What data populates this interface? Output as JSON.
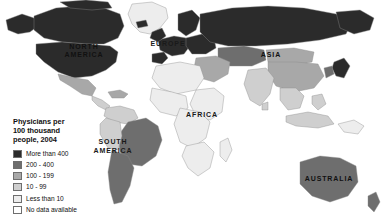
{
  "map": {
    "background_color": "#ffffff",
    "border_color": "#8c8c8c",
    "region_labels": [
      {
        "name": "north-america",
        "text": "NORTH",
        "x": 84,
        "y": 49,
        "on_dark": true
      },
      {
        "name": "north-america",
        "text": "AMERICA",
        "x": 84,
        "y": 57,
        "on_dark": true
      },
      {
        "name": "south-america",
        "text": "SOUTH",
        "x": 113,
        "y": 144,
        "on_dark": false
      },
      {
        "name": "south-america",
        "text": "AMERICA",
        "x": 113,
        "y": 153,
        "on_dark": false
      },
      {
        "name": "europe",
        "text": "EUROPE",
        "x": 168,
        "y": 46,
        "on_dark": false
      },
      {
        "name": "africa",
        "text": "AFRICA",
        "x": 202,
        "y": 117,
        "on_dark": false
      },
      {
        "name": "asia",
        "text": "ASIA",
        "x": 271,
        "y": 57,
        "on_dark": true
      },
      {
        "name": "australia",
        "text": "AUSTRALIA",
        "x": 329,
        "y": 181,
        "on_dark": true
      }
    ]
  },
  "legend": {
    "title": "Physicians per\n100 thousand\npeople, 2004",
    "items": [
      {
        "label": "More than 400",
        "color": "#2b2b2b"
      },
      {
        "label": "200 - 400",
        "color": "#6e6e6e"
      },
      {
        "label": "100 - 199",
        "color": "#a8a8a8"
      },
      {
        "label": "10 - 99",
        "color": "#cfcfcf"
      },
      {
        "label": "Less than 10",
        "color": "#ededed"
      },
      {
        "label": "No data available",
        "color": "#ffffff"
      }
    ]
  },
  "palette": {
    "more_than_400": "#2b2b2b",
    "v200_400": "#6e6e6e",
    "v100_199": "#a8a8a8",
    "v10_99": "#cfcfcf",
    "less_than_10": "#ededed",
    "no_data": "#ffffff",
    "outline": "#8a8a8a"
  }
}
